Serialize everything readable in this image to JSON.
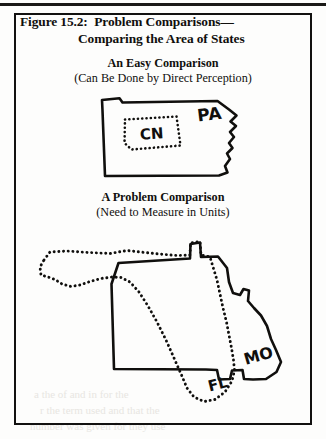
{
  "page": {
    "background_color": "#fdfdfc",
    "ink_color": "#100f0d"
  },
  "figure": {
    "border_color": "#121110",
    "title_line_1": "Figure 15.2:  Problem Comparisons—",
    "title_line_2": "Comparing the Area of States"
  },
  "panels": [
    {
      "id": "easy",
      "heading": "An Easy Comparison",
      "subheading": "(Can Be Done by Direct Perception)",
      "shapes": [
        {
          "name": "pennsylvania",
          "label": "PA",
          "style": "solid-outline"
        },
        {
          "name": "connecticut",
          "label": "CN",
          "style": "dotted-outline"
        }
      ]
    },
    {
      "id": "problem",
      "heading": "A Problem Comparison",
      "subheading": "(Need to Measure in Units)",
      "shapes": [
        {
          "name": "missouri",
          "label": "MO",
          "style": "solid-outline"
        },
        {
          "name": "florida",
          "label": "FL",
          "style": "dotted-outline"
        }
      ]
    }
  ],
  "labels": {
    "pa": "PA",
    "cn": "CN",
    "mo": "MO",
    "fl": "FL"
  },
  "bleed_through": {
    "line_1": "a the  of  and  in  for  the",
    "line_2": "r  the  term used  and  that  the",
    "line_3": "number  was  given  for  they  use"
  }
}
